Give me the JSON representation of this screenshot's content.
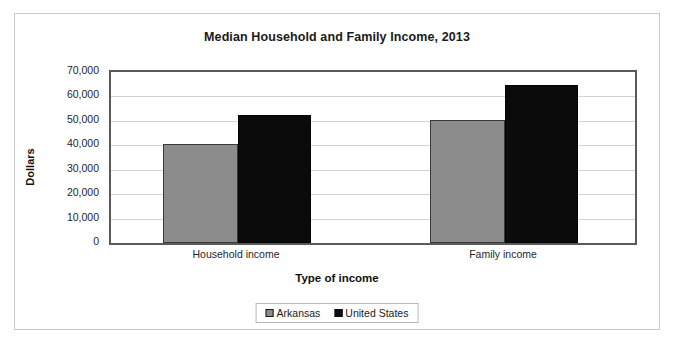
{
  "chart_data": {
    "type": "bar",
    "title": "Median Household and Family Income, 2013",
    "xlabel": "Type of income",
    "ylabel": "Dollars",
    "categories": [
      "Household income",
      "Family income"
    ],
    "series": [
      {
        "name": "Arkansas",
        "color": "#8c8c8c",
        "values": [
          40500,
          50500
        ]
      },
      {
        "name": "United States",
        "color": "#0b0b0b",
        "values": [
          52500,
          64500
        ]
      }
    ],
    "ylim": [
      0,
      70000
    ],
    "ytick_step": 10000,
    "ytick_labels": [
      "0",
      "10,000",
      "20,000",
      "30,000",
      "40,000",
      "50,000",
      "60,000",
      "70,000"
    ],
    "ytick_values": [
      0,
      10000,
      20000,
      30000,
      40000,
      50000,
      60000,
      70000
    ],
    "grid": true,
    "legend_position": "bottom"
  },
  "legend": {
    "items": [
      {
        "label": "Arkansas",
        "swatch": "gray-square-swatch"
      },
      {
        "label": "United States",
        "swatch": "black-square-swatch"
      }
    ]
  }
}
